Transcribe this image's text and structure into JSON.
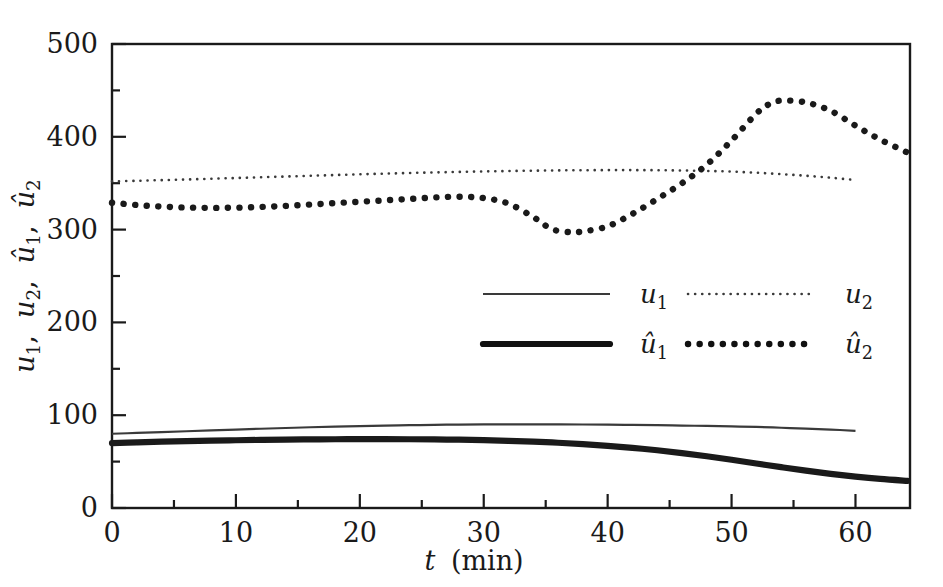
{
  "chart_data": {
    "type": "line",
    "title": "",
    "xlabel": "t (min)",
    "ylabel": "u1, u2, û1, û2",
    "xlim": [
      0,
      64.4
    ],
    "ylim": [
      0,
      500
    ],
    "xticks": [
      0,
      10,
      20,
      30,
      40,
      50,
      60
    ],
    "yticks": [
      0,
      100,
      200,
      300,
      400,
      500
    ],
    "xtick_labels": [
      "0",
      "10",
      "20",
      "30",
      "40",
      "50",
      "60"
    ],
    "ytick_labels": [
      "0",
      "100",
      "200",
      "300",
      "400",
      "500"
    ],
    "xminor_step": 5,
    "yminor_step": 50,
    "grid": false,
    "legend_position": "center",
    "series": [
      {
        "name": "u_1",
        "label": "u1",
        "style": "thin-solid",
        "color": "#3a3a3a",
        "width": 2,
        "x": [
          0,
          2,
          4,
          6,
          8,
          10,
          12,
          14,
          16,
          18,
          20,
          22,
          24,
          26,
          28,
          30,
          32,
          34,
          36,
          38,
          40,
          42,
          44,
          46,
          48,
          50,
          52,
          54,
          56,
          58,
          60
        ],
        "y": [
          80.0,
          80.9,
          81.8,
          82.7,
          83.6,
          84.5,
          85.4,
          86.2,
          87.0,
          87.7,
          88.3,
          88.8,
          89.2,
          89.6,
          89.9,
          90.1,
          90.2,
          90.2,
          90.1,
          90.0,
          89.8,
          89.5,
          89.2,
          88.8,
          88.4,
          87.9,
          87.4,
          86.5,
          85.6,
          84.5,
          83.2
        ]
      },
      {
        "name": "u_2",
        "label": "u2",
        "style": "fine-dotted",
        "color": "#3a3a3a",
        "width": 2,
        "x": [
          0,
          2,
          4,
          6,
          8,
          10,
          12,
          14,
          16,
          18,
          20,
          22,
          24,
          26,
          28,
          30,
          32,
          34,
          36,
          38,
          40,
          42,
          44,
          46,
          48,
          50,
          52,
          54,
          56,
          58,
          60
        ],
        "y": [
          352.0,
          352.6,
          353.3,
          354.0,
          354.8,
          355.6,
          356.4,
          357.2,
          358.0,
          358.8,
          359.6,
          360.3,
          361.0,
          361.6,
          362.2,
          362.7,
          363.1,
          363.5,
          363.8,
          364.0,
          364.1,
          364.1,
          364.0,
          363.7,
          363.2,
          362.5,
          361.3,
          359.8,
          358.0,
          355.9,
          353.4
        ]
      },
      {
        "name": "uhat_1",
        "label": "û1",
        "style": "thick-solid",
        "color": "#1a1a1a",
        "width": 6,
        "x": [
          0,
          2,
          4,
          6,
          8,
          10,
          12,
          14,
          16,
          18,
          20,
          22,
          24,
          26,
          28,
          30,
          32,
          34,
          36,
          38,
          40,
          42,
          44,
          46,
          48,
          50,
          52,
          54,
          56,
          58,
          60,
          62,
          64.2
        ],
        "y": [
          70.0,
          70.8,
          71.5,
          72.1,
          72.6,
          73.0,
          73.4,
          73.7,
          73.9,
          74.1,
          74.2,
          74.2,
          74.1,
          73.9,
          73.6,
          73.1,
          72.4,
          71.5,
          70.3,
          68.8,
          67.0,
          64.8,
          62.2,
          59.2,
          55.8,
          52.0,
          48.0,
          44.0,
          40.2,
          36.8,
          33.8,
          31.3,
          29.2
        ]
      },
      {
        "name": "uhat_2",
        "label": "û2",
        "style": "thick-dotted",
        "color": "#1a1a1a",
        "width": 6,
        "x": [
          0,
          2,
          4,
          6,
          8,
          10,
          12,
          14,
          16,
          18,
          20,
          22,
          24,
          26,
          28,
          30,
          32,
          34,
          35.5,
          37,
          38,
          40,
          42,
          44,
          46,
          48,
          50,
          52,
          53,
          54,
          56,
          58,
          60,
          62,
          64.2
        ],
        "y": [
          329.0,
          326.5,
          324.8,
          323.8,
          323.4,
          323.6,
          324.4,
          325.5,
          327.0,
          328.5,
          330.0,
          331.5,
          333.0,
          334.6,
          335.4,
          334.0,
          328.0,
          313.5,
          300.5,
          297.2,
          298.0,
          303.5,
          317.0,
          333.0,
          350.0,
          370.0,
          396.0,
          425.0,
          435.0,
          439.0,
          437.0,
          428.0,
          412.0,
          397.0,
          383.0
        ]
      }
    ]
  },
  "legend": {
    "entries": [
      {
        "id": "u1",
        "label": "u",
        "subscript": "1",
        "hat": false,
        "style": "thin-solid"
      },
      {
        "id": "u2",
        "label": "u",
        "subscript": "2",
        "hat": false,
        "style": "fine-dotted"
      },
      {
        "id": "uh1",
        "label": "u",
        "subscript": "1",
        "hat": true,
        "style": "thick-solid"
      },
      {
        "id": "uh2",
        "label": "u",
        "subscript": "2",
        "hat": true,
        "style": "thick-dotted"
      }
    ]
  },
  "axes": {
    "x_title_var": "t",
    "x_title_unit": "(min)",
    "y_title_parts": [
      "u",
      "1",
      "u",
      "2",
      "u",
      "1",
      "u",
      "2"
    ]
  },
  "colors": {
    "frame": "#1a1a1a",
    "text": "#1a1a1a",
    "thin_series": "#3a3a3a",
    "thick_series": "#111111",
    "background": "#ffffff"
  }
}
